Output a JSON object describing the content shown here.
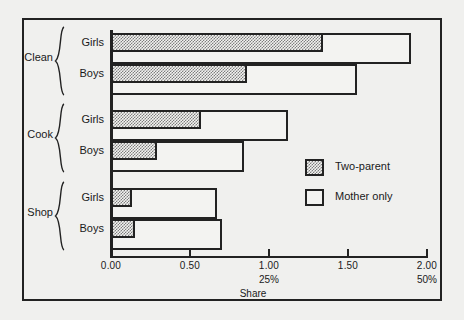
{
  "chart_data": {
    "type": "bar",
    "orientation": "horizontal",
    "title": "",
    "xlabel": "Share",
    "ylabel": "",
    "xlim": [
      0.0,
      2.0
    ],
    "xticks": [
      0.0,
      0.5,
      1.0,
      1.5,
      2.0
    ],
    "xtick_labels": [
      "0.00",
      "0.50",
      "1.00",
      "1.50",
      "2.00"
    ],
    "secondary_xtick_labels": [
      null,
      null,
      "25%",
      null,
      "50%"
    ],
    "grid": false,
    "legend_position": "center-right",
    "legend": [
      "Two-parent",
      "Mother only"
    ],
    "groups": [
      "Clean",
      "Cook",
      "Shop"
    ],
    "subcategories": [
      "Girls",
      "Boys"
    ],
    "categories": [
      "Clean / Girls",
      "Clean / Boys",
      "Cook / Girls",
      "Cook / Boys",
      "Shop / Girls",
      "Shop / Boys"
    ],
    "series": [
      {
        "name": "Two-parent",
        "values": [
          1.34,
          0.86,
          0.57,
          0.29,
          0.13,
          0.15
        ]
      },
      {
        "name": "Mother only",
        "values": [
          1.9,
          1.56,
          1.12,
          0.84,
          0.67,
          0.7
        ]
      }
    ]
  },
  "axis": {
    "x_title": "Share",
    "ticks": [
      {
        "value": 0.0,
        "label": "0.00",
        "sub": ""
      },
      {
        "value": 0.5,
        "label": "0.50",
        "sub": ""
      },
      {
        "value": 1.0,
        "label": "1.00",
        "sub": "25%"
      },
      {
        "value": 1.5,
        "label": "1.50",
        "sub": ""
      },
      {
        "value": 2.0,
        "label": "2.00",
        "sub": "50%"
      }
    ]
  },
  "groups": [
    {
      "label": "Clean",
      "rows": [
        {
          "label": "Girls",
          "two_parent": 1.34,
          "mother_only": 1.9
        },
        {
          "label": "Boys",
          "two_parent": 0.86,
          "mother_only": 1.56
        }
      ]
    },
    {
      "label": "Cook",
      "rows": [
        {
          "label": "Girls",
          "two_parent": 0.57,
          "mother_only": 1.12
        },
        {
          "label": "Boys",
          "two_parent": 0.29,
          "mother_only": 0.84
        }
      ]
    },
    {
      "label": "Shop",
      "rows": [
        {
          "label": "Girls",
          "two_parent": 0.13,
          "mother_only": 0.67
        },
        {
          "label": "Boys",
          "two_parent": 0.15,
          "mother_only": 0.7
        }
      ]
    }
  ],
  "legend": {
    "items": [
      {
        "label": "Two-parent",
        "style": "hatch"
      },
      {
        "label": "Mother only",
        "style": "open"
      }
    ]
  },
  "colors": {
    "ink": "#222222",
    "background": "#f0f0ee",
    "bar_fill_open": "#f3f3f1",
    "bar_fill_hatch": "#7e7e7e"
  }
}
